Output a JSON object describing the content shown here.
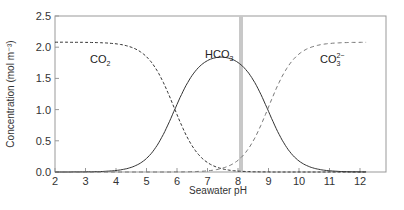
{
  "chart_data": {
    "type": "line",
    "title": "",
    "xlabel": "Seawater pH",
    "ylabel": "Concentration (mol m⁻³)",
    "xlim": [
      2,
      12.9
    ],
    "ylim": [
      0,
      2.5
    ],
    "x_ticks": [
      "2",
      "3",
      "4",
      "5",
      "6",
      "7",
      "8",
      "9",
      "10",
      "11",
      "12"
    ],
    "y_ticks": [
      "0.0",
      "0.5",
      "1.0",
      "1.5",
      "2.0",
      "2.5"
    ],
    "grid": false,
    "legend": "none (inline labels)",
    "x": [
      2,
      3,
      4,
      5,
      5.5,
      6,
      6.5,
      7,
      7.5,
      8,
      8.1,
      8.5,
      9,
      9.5,
      10,
      11,
      12,
      12.2
    ],
    "series": [
      {
        "name": "CO2",
        "style": "dashed",
        "values": [
          2.08,
          2.08,
          2.06,
          1.84,
          1.47,
          0.92,
          0.42,
          0.15,
          0.05,
          0.02,
          0.01,
          0.0,
          0.0,
          0.0,
          0.0,
          0.0,
          0.0,
          0.0
        ]
      },
      {
        "name": "HCO3-",
        "style": "solid",
        "values": [
          0.0,
          0.01,
          0.02,
          0.23,
          0.6,
          1.15,
          1.62,
          1.86,
          1.91,
          1.8,
          1.75,
          1.42,
          0.93,
          0.43,
          0.16,
          0.02,
          0.0,
          0.0
        ]
      },
      {
        "name": "CO3 2-",
        "style": "dashed",
        "values": [
          0.0,
          0.0,
          0.0,
          0.0,
          0.0,
          0.0,
          0.01,
          0.03,
          0.09,
          0.24,
          0.3,
          0.64,
          1.15,
          1.65,
          1.92,
          2.06,
          2.08,
          2.08
        ]
      }
    ],
    "annotations": [
      {
        "type": "vertical_band",
        "x": 8.1,
        "label": "present-day seawater pH",
        "color": "#c8c8c8"
      }
    ],
    "labels": {
      "co2": {
        "base": "CO",
        "sub": "2",
        "sup": ""
      },
      "hco3": {
        "base": "HCO",
        "sub": "3",
        "sup": "−"
      },
      "co3": {
        "base": "CO",
        "sub": "3",
        "sup": "2−"
      }
    }
  },
  "colors": {
    "axis": "#888888",
    "curve": "#333333",
    "band": "#c8c8c8"
  }
}
